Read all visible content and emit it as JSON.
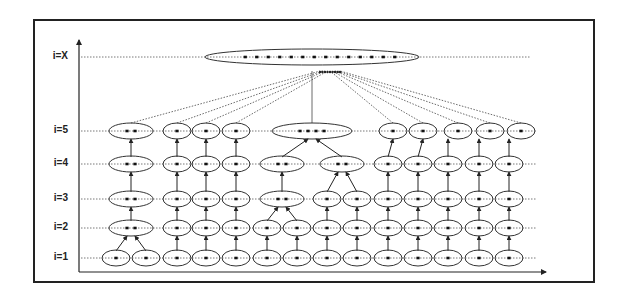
{
  "diagram": {
    "title": "",
    "levels": [
      {
        "label": "i=X",
        "y": 57
      },
      {
        "label": "i=5",
        "y": 131
      },
      {
        "label": "i=4",
        "y": 164
      },
      {
        "label": "i=3",
        "y": 199
      },
      {
        "label": "i=2",
        "y": 228
      },
      {
        "label": "i=1",
        "y": 258
      }
    ],
    "colors": {
      "line": "#222222",
      "dotted": "#444444",
      "background": "#ffffff"
    },
    "frame": {
      "x": 33,
      "y": 19,
      "w": 562,
      "h": 264
    },
    "axes": {
      "origin_x": 79,
      "origin_y": 272,
      "y_top": 40,
      "x_right": 546
    },
    "columns": [
      116,
      147,
      177,
      206,
      236,
      267,
      297,
      327,
      357,
      388,
      418,
      448,
      479,
      509
    ],
    "nodes": [
      {
        "level": "i=1",
        "cx": 116,
        "w": 28,
        "dots": 1
      },
      {
        "level": "i=1",
        "cx": 146,
        "w": 28,
        "dots": 1
      },
      {
        "level": "i=1",
        "cx": 177,
        "w": 28,
        "dots": 1
      },
      {
        "level": "i=1",
        "cx": 206,
        "w": 28,
        "dots": 1
      },
      {
        "level": "i=1",
        "cx": 236,
        "w": 28,
        "dots": 1
      },
      {
        "level": "i=1",
        "cx": 267,
        "w": 28,
        "dots": 1
      },
      {
        "level": "i=1",
        "cx": 297,
        "w": 28,
        "dots": 1
      },
      {
        "level": "i=1",
        "cx": 327,
        "w": 28,
        "dots": 1
      },
      {
        "level": "i=1",
        "cx": 357,
        "w": 28,
        "dots": 1
      },
      {
        "level": "i=1",
        "cx": 388,
        "w": 28,
        "dots": 1
      },
      {
        "level": "i=1",
        "cx": 418,
        "w": 28,
        "dots": 1
      },
      {
        "level": "i=1",
        "cx": 448,
        "w": 28,
        "dots": 1
      },
      {
        "level": "i=1",
        "cx": 479,
        "w": 28,
        "dots": 1
      },
      {
        "level": "i=1",
        "cx": 509,
        "w": 28,
        "dots": 1
      },
      {
        "level": "i=2",
        "cx": 131,
        "w": 44,
        "dots": 2
      },
      {
        "level": "i=2",
        "cx": 177,
        "w": 28,
        "dots": 1
      },
      {
        "level": "i=2",
        "cx": 206,
        "w": 28,
        "dots": 1
      },
      {
        "level": "i=2",
        "cx": 236,
        "w": 28,
        "dots": 1
      },
      {
        "level": "i=2",
        "cx": 267,
        "w": 28,
        "dots": 1
      },
      {
        "level": "i=2",
        "cx": 297,
        "w": 28,
        "dots": 1
      },
      {
        "level": "i=2",
        "cx": 327,
        "w": 28,
        "dots": 1
      },
      {
        "level": "i=2",
        "cx": 357,
        "w": 28,
        "dots": 1
      },
      {
        "level": "i=2",
        "cx": 388,
        "w": 28,
        "dots": 1
      },
      {
        "level": "i=2",
        "cx": 418,
        "w": 28,
        "dots": 1
      },
      {
        "level": "i=2",
        "cx": 448,
        "w": 28,
        "dots": 1
      },
      {
        "level": "i=2",
        "cx": 479,
        "w": 28,
        "dots": 1
      },
      {
        "level": "i=2",
        "cx": 509,
        "w": 28,
        "dots": 1
      },
      {
        "level": "i=3",
        "cx": 131,
        "w": 44,
        "dots": 2
      },
      {
        "level": "i=3",
        "cx": 177,
        "w": 28,
        "dots": 1
      },
      {
        "level": "i=3",
        "cx": 206,
        "w": 28,
        "dots": 1
      },
      {
        "level": "i=3",
        "cx": 236,
        "w": 28,
        "dots": 1
      },
      {
        "level": "i=3",
        "cx": 282,
        "w": 44,
        "dots": 2
      },
      {
        "level": "i=3",
        "cx": 327,
        "w": 28,
        "dots": 1
      },
      {
        "level": "i=3",
        "cx": 357,
        "w": 28,
        "dots": 1
      },
      {
        "level": "i=3",
        "cx": 388,
        "w": 28,
        "dots": 1
      },
      {
        "level": "i=3",
        "cx": 418,
        "w": 28,
        "dots": 1
      },
      {
        "level": "i=3",
        "cx": 448,
        "w": 28,
        "dots": 1
      },
      {
        "level": "i=3",
        "cx": 479,
        "w": 28,
        "dots": 1
      },
      {
        "level": "i=3",
        "cx": 509,
        "w": 28,
        "dots": 1
      },
      {
        "level": "i=4",
        "cx": 131,
        "w": 44,
        "dots": 2
      },
      {
        "level": "i=4",
        "cx": 177,
        "w": 28,
        "dots": 1
      },
      {
        "level": "i=4",
        "cx": 206,
        "w": 28,
        "dots": 1
      },
      {
        "level": "i=4",
        "cx": 236,
        "w": 28,
        "dots": 1
      },
      {
        "level": "i=4",
        "cx": 282,
        "w": 44,
        "dots": 2
      },
      {
        "level": "i=4",
        "cx": 342,
        "w": 44,
        "dots": 2
      },
      {
        "level": "i=4",
        "cx": 388,
        "w": 28,
        "dots": 1
      },
      {
        "level": "i=4",
        "cx": 418,
        "w": 28,
        "dots": 1
      },
      {
        "level": "i=4",
        "cx": 448,
        "w": 28,
        "dots": 1
      },
      {
        "level": "i=4",
        "cx": 479,
        "w": 28,
        "dots": 1
      },
      {
        "level": "i=4",
        "cx": 509,
        "w": 28,
        "dots": 1
      },
      {
        "level": "i=5",
        "cx": 131,
        "w": 44,
        "dots": 2
      },
      {
        "level": "i=5",
        "cx": 177,
        "w": 28,
        "dots": 1
      },
      {
        "level": "i=5",
        "cx": 206,
        "w": 28,
        "dots": 1
      },
      {
        "level": "i=5",
        "cx": 236,
        "w": 28,
        "dots": 1
      },
      {
        "level": "i=5",
        "cx": 312,
        "w": 80,
        "dots": 4
      },
      {
        "level": "i=5",
        "cx": 393,
        "w": 28,
        "dots": 1
      },
      {
        "level": "i=5",
        "cx": 423,
        "w": 28,
        "dots": 1
      },
      {
        "level": "i=5",
        "cx": 458,
        "w": 28,
        "dots": 1
      },
      {
        "level": "i=5",
        "cx": 490,
        "w": 28,
        "dots": 1
      },
      {
        "level": "i=5",
        "cx": 521,
        "w": 28,
        "dots": 1
      },
      {
        "level": "i=X",
        "cx": 312,
        "w": 214,
        "dots": 14
      }
    ],
    "merges": [
      {
        "from": [
          [
            116,
            258
          ],
          [
            146,
            258
          ]
        ],
        "to": [
          131,
          228
        ]
      },
      {
        "from": [
          [
            267,
            228
          ],
          [
            297,
            228
          ]
        ],
        "to": [
          282,
          199
        ]
      },
      {
        "from": [
          [
            327,
            199
          ],
          [
            357,
            199
          ]
        ],
        "to": [
          342,
          164
        ]
      },
      {
        "from": [
          [
            282,
            164
          ],
          [
            342,
            164
          ]
        ],
        "to": [
          312,
          131
        ]
      }
    ],
    "top_links_from": [
      [
        131,
        131
      ],
      [
        177,
        131
      ],
      [
        206,
        131
      ],
      [
        236,
        131
      ],
      [
        393,
        131
      ],
      [
        423,
        131
      ],
      [
        458,
        131
      ],
      [
        490,
        131
      ],
      [
        521,
        131
      ]
    ],
    "top_link_target": [
      330,
      71
    ],
    "center_link": {
      "from": [
        312,
        123
      ],
      "to": [
        312,
        71
      ]
    }
  }
}
